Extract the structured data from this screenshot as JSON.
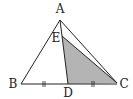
{
  "diagram": {
    "type": "triangle-geometry",
    "colors": {
      "stroke": "#222222",
      "shade": "#b4b4b4",
      "background": "#ffffff"
    },
    "points": {
      "A": {
        "label": "A",
        "x": 60,
        "y": 20,
        "lx": 60,
        "ly": 13
      },
      "B": {
        "label": "B",
        "x": 21,
        "y": 84,
        "lx": 13,
        "ly": 88
      },
      "C": {
        "label": "C",
        "x": 117,
        "y": 83,
        "lx": 124,
        "ly": 88
      },
      "D": {
        "label": "D",
        "x": 68,
        "y": 84,
        "lx": 68,
        "ly": 97
      },
      "E": {
        "label": "E",
        "x": 62,
        "y": 36,
        "lx": 56,
        "ly": 42
      }
    },
    "segments": [
      "AB",
      "AC",
      "BC",
      "AD",
      "EC"
    ],
    "shaded_region": "triangle EDC",
    "equal_marks": {
      "segments": [
        "BD",
        "DC"
      ],
      "style": "double-tick"
    }
  }
}
